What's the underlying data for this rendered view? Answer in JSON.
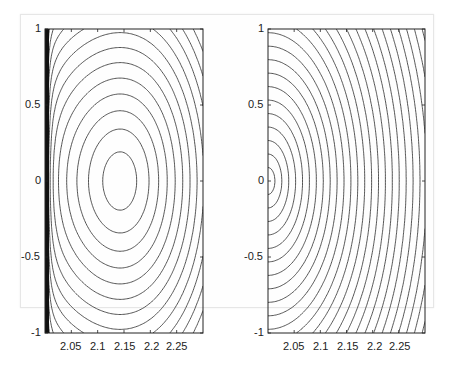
{
  "chart_data": [
    {
      "type": "contour",
      "title": "",
      "xlabel": "",
      "ylabel": "",
      "xlim": [
        2.0,
        2.3
      ],
      "ylim": [
        -1,
        1
      ],
      "xticks": [
        "2.05",
        "2.1",
        "2.15",
        "2.2",
        "2.25"
      ],
      "yticks": [
        "1",
        "0.5",
        "0",
        "-0.5",
        "-1"
      ],
      "grid": false,
      "legend": null,
      "description": "Closed contours centered near (2.14, 0) with dense lines crowding the left edge at x=2.0",
      "center": [
        2.14,
        0
      ]
    },
    {
      "type": "contour",
      "title": "",
      "xlabel": "",
      "ylabel": "",
      "xlim": [
        2.0,
        2.3
      ],
      "ylim": [
        -1,
        1
      ],
      "xticks": [
        "2.05",
        "2.1",
        "2.15",
        "2.2",
        "2.25"
      ],
      "yticks": [
        "1",
        "0.5",
        "0",
        "-0.5",
        "-1"
      ],
      "grid": false,
      "legend": null,
      "description": "Concentric arcs centered at left edge (2.0, 0), evenly spaced, radiating to the right",
      "center": [
        2.0,
        0
      ]
    }
  ],
  "plots": {
    "left": {
      "yticks": [
        "1",
        "0.5",
        "0",
        "-0.5",
        "-1"
      ],
      "xticks": [
        "2.05",
        "2.1",
        "2.15",
        "2.2",
        "2.25"
      ]
    },
    "right": {
      "yticks": [
        "1",
        "0.5",
        "0",
        "-0.5",
        "-1"
      ],
      "xticks": [
        "2.05",
        "2.1",
        "2.15",
        "2.2",
        "2.25"
      ]
    }
  }
}
